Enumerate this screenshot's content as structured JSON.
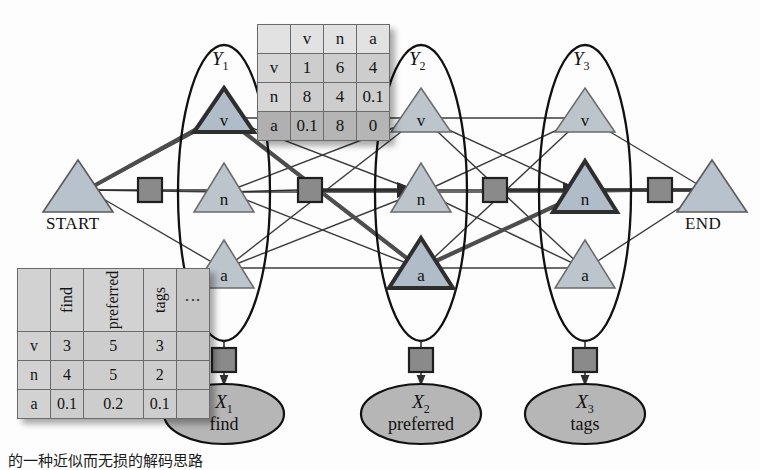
{
  "figure": {
    "type": "hmm-trellis-factor-graph",
    "caption": "的一种近似而无损的解码思路"
  },
  "endpoints": {
    "start": {
      "label": "START"
    },
    "end": {
      "label": "END"
    }
  },
  "columns": [
    {
      "id": "Y1",
      "label": "Y",
      "subscript": "1",
      "states": [
        {
          "tag": "v",
          "selected": true
        },
        {
          "tag": "n",
          "selected": false
        },
        {
          "tag": "a",
          "selected": false
        }
      ],
      "observation": {
        "var": "X",
        "subscript": "1",
        "word": "find"
      }
    },
    {
      "id": "Y2",
      "label": "Y",
      "subscript": "2",
      "states": [
        {
          "tag": "v",
          "selected": false
        },
        {
          "tag": "n",
          "selected": false
        },
        {
          "tag": "a",
          "selected": true
        }
      ],
      "observation": {
        "var": "X",
        "subscript": "2",
        "word": "preferred"
      }
    },
    {
      "id": "Y3",
      "label": "Y",
      "subscript": "3",
      "states": [
        {
          "tag": "v",
          "selected": false
        },
        {
          "tag": "n",
          "selected": true
        },
        {
          "tag": "a",
          "selected": false
        }
      ],
      "observation": {
        "var": "X",
        "subscript": "3",
        "word": "tags"
      }
    }
  ],
  "best_path": [
    "v",
    "a",
    "n"
  ],
  "transition_table": {
    "corner": "",
    "columns": [
      "v",
      "n",
      "a"
    ],
    "rows": [
      {
        "header": "v",
        "values": [
          "1",
          "6",
          "4"
        ]
      },
      {
        "header": "n",
        "values": [
          "8",
          "4",
          "0.1"
        ]
      },
      {
        "header": "a",
        "values": [
          "0.1",
          "8",
          "0"
        ]
      }
    ]
  },
  "emission_table": {
    "corner": "",
    "columns": [
      "find",
      "preferred",
      "tags",
      "⋮"
    ],
    "rows": [
      {
        "header": "v",
        "values": [
          "3",
          "5",
          "3",
          ""
        ]
      },
      {
        "header": "n",
        "values": [
          "4",
          "5",
          "2",
          ""
        ]
      },
      {
        "header": "a",
        "values": [
          "0.1",
          "0.2",
          "0.1",
          ""
        ]
      }
    ]
  },
  "colors": {
    "node_fill": "#b8c2cc",
    "node_fill_plain": "#bcc4cc",
    "node_stroke": "#4a4a4a",
    "node_stroke_selected": "#2e2e2e",
    "factor_fill": "#8a8a8a",
    "factor_stroke": "#222222",
    "observation_fill": "#b6b6b6",
    "edge": "#3b3b3b",
    "path": "#4d4d4d",
    "table_fill": "#cdcdcd"
  }
}
